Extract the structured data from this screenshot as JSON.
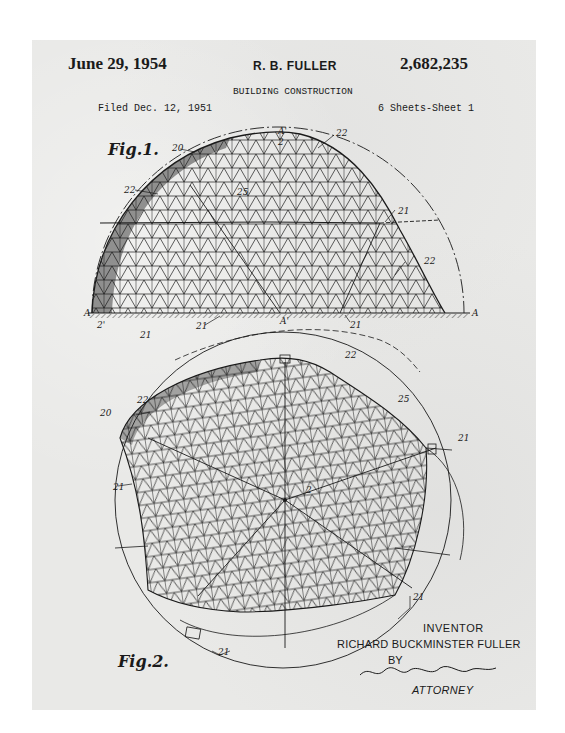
{
  "document": {
    "type": "US Patent Drawing",
    "date": "June 29, 1954",
    "inventor_short": "R. B. FULLER",
    "patent_number": "2,682,235",
    "title": "BUILDING CONSTRUCTION",
    "filed": "Filed Dec. 12, 1951",
    "sheets": "6 Sheets-Sheet 1"
  },
  "figures": [
    {
      "label": "Fig.1.",
      "description": "Elevation view of geodesic dome (hemisphere) on ground line A–A",
      "reference_numerals": [
        "20",
        "22",
        "A'",
        "2",
        "25",
        "21",
        "22",
        "A",
        "2'",
        "21",
        "21",
        "A'",
        "21",
        "A"
      ]
    },
    {
      "label": "Fig.2.",
      "description": "Plan/perspective view of geodesic sphere structure",
      "reference_numerals": [
        "22",
        "22",
        "20",
        "25",
        "21",
        "21",
        "2",
        "21",
        "21"
      ]
    }
  ],
  "signature_block": {
    "inventor_label": "INVENTOR",
    "inventor_name": "RICHARD BUCKMINSTER FULLER",
    "by": "BY",
    "attorney_signature": "Pollard and Johnston",
    "attorney_label": "ATTORNEY"
  },
  "refs": {
    "fig1": {
      "r20": "20",
      "r22a": "22",
      "rA1": "A'",
      "r2": "2",
      "r25": "25",
      "r22b": "22",
      "r21a": "21",
      "r22c": "22",
      "rA": "A",
      "rA2": "A",
      "r2p": "2'",
      "r21b": "21",
      "r21c": "21",
      "rA1b": "A'",
      "r21d": "21"
    },
    "fig2": {
      "r22a": "22",
      "r22b": "22",
      "r20": "20",
      "r25": "25",
      "r21a": "21",
      "r21b": "21",
      "r2": "2",
      "r21c": "21",
      "r21d": "21"
    }
  },
  "colors": {
    "paper": "#e9e9e7",
    "ink": "#1a1a1a",
    "background": "#ffffff"
  }
}
